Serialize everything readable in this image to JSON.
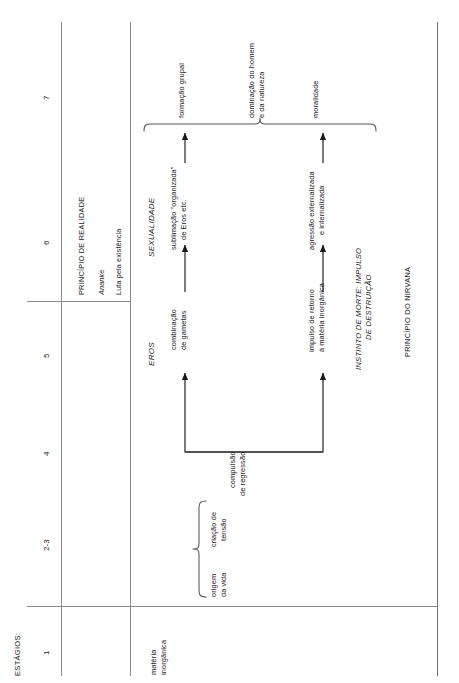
{
  "diagram": {
    "axis_label": "ESTÁGIOS:",
    "stages": [
      {
        "id": "stage-1",
        "label": "1"
      },
      {
        "id": "stage-2-3",
        "label": "2-3"
      },
      {
        "id": "stage-4",
        "label": "4"
      },
      {
        "id": "stage-5",
        "label": "5"
      },
      {
        "id": "stage-6",
        "label": "6"
      },
      {
        "id": "stage-7",
        "label": "7"
      }
    ],
    "principle_box": {
      "title": "PRINCÍPIO DE REALIDADE",
      "subtitle": "Ananke",
      "note": "Luta pela existência"
    },
    "eros_track": {
      "heading_eros": "EROS",
      "heading_sexualidade": "SEXUALIDADE",
      "node_gametas_line1": "combinação",
      "node_gametas_line2": "de gametas",
      "node_sublimacao_line1": "sublimação \"organizada\"",
      "node_sublimacao_line2": "de Eros etc.",
      "outcome_grupal": "formação grupal"
    },
    "death_track": {
      "heading_line1": "INSTINTO DE MORTE: IMPULSO",
      "heading_line2": "DE DESTRUIÇÃO",
      "principle": "PRINCÍPIO DO NIRVANA",
      "node_retorno_line1": "impulso de retorno",
      "node_retorno_line2": "à matéria inorgânica",
      "node_agressao_line1": "agressão externalizada",
      "node_agressao_line2": "e internalizada",
      "outcome_dominacao_line1": "dominação do homem",
      "outcome_dominacao_line2": "e da natureza",
      "outcome_moralidade": "moralidade"
    },
    "origin": {
      "matter_line1": "matéria",
      "matter_line2": "inorgânica",
      "origem_line1": "origem",
      "origem_line2": "da vida",
      "tensao_line1": "criação de",
      "tensao_line2": "tensão",
      "regressao_line1": "compulsão",
      "regressao_line2": "de regressão"
    },
    "colors": {
      "ink": "#1a1a1a",
      "rule": "#8c8c8c",
      "background": "#ffffff"
    }
  }
}
